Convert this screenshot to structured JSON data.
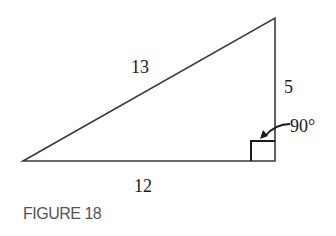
{
  "figure": {
    "caption": "FIGURE 18",
    "shape": "right-triangle",
    "vertices": {
      "left": [
        23,
        161
      ],
      "right_angle": [
        275,
        161
      ],
      "top": [
        275,
        18
      ]
    },
    "sides": {
      "hypotenuse": "13",
      "vertical_leg": "5",
      "horizontal_leg": "12"
    },
    "angle_label": "90°",
    "line_color": "#3a3a3a"
  }
}
